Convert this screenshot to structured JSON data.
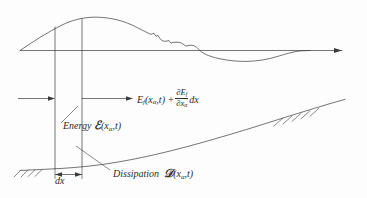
{
  "figure": {
    "background_color": "#fdfdfd",
    "line_color": "#3a3a3a"
  },
  "labels": {
    "flux": {
      "name": "energy-flux-expression",
      "lead": "E",
      "lead_sub": "f",
      "args": "(x",
      "arg_sub": "α",
      "args_tail": ",t) +",
      "frac_num_lead": "∂E",
      "frac_num_sub": "f",
      "frac_den_lead": "∂x",
      "frac_den_sub": "α",
      "tail": "dx",
      "plain_text": "E_f(xα,t) + (∂E_f/∂xα) dx"
    },
    "energy": {
      "name": "energy-label",
      "word": "Energy",
      "symbol": "ℰ",
      "args": "(x",
      "arg_sub": "α",
      "args_tail": ",t)",
      "plain_text": "Energy ℰ(xα,t)"
    },
    "dissipation": {
      "name": "dissipation-label",
      "word": "Dissipation",
      "symbol": "𝒟",
      "args": "(x",
      "arg_sub": "α",
      "args_tail": ",t)",
      "plain_text": "Dissipation 𝒟(xα,t)"
    },
    "dx": {
      "name": "dx-dimension-label",
      "text": "dx"
    }
  },
  "elements": {
    "axis": "horizontal-datum-axis",
    "wave": "free-surface-wave-profile",
    "bed": "sloping-seabed-profile",
    "bed_hatching": "seabed-hatching",
    "section_left": "left-section-line",
    "section_right": "right-section-line",
    "inflow_arrow": "incoming-energy-flux-arrow",
    "outflow_arrow": "outgoing-energy-flux-arrow",
    "dx_arrow": "dx-dimension-arrow",
    "energy_leader": "energy-leader-line",
    "dissipation_leader": "dissipation-leader-line"
  }
}
